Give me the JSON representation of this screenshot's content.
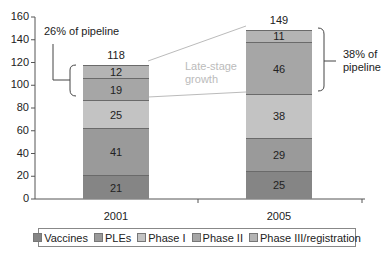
{
  "chart_data": {
    "type": "bar",
    "stacked": true,
    "categories": [
      "2001",
      "2005"
    ],
    "series": [
      {
        "name": "Vaccines",
        "values": [
          21,
          25
        ],
        "color": "#858585"
      },
      {
        "name": "PLEs",
        "values": [
          41,
          29
        ],
        "color": "#9a9a9a"
      },
      {
        "name": "Phase I",
        "values": [
          25,
          38
        ],
        "color": "#c3c3c3"
      },
      {
        "name": "Phase II",
        "values": [
          19,
          46
        ],
        "color": "#a6a6a6"
      },
      {
        "name": "Phase III/registration",
        "values": [
          12,
          11
        ],
        "color": "#b4b4b4"
      }
    ],
    "totals": [
      118,
      149
    ],
    "title": "",
    "xlabel": "",
    "ylabel": "",
    "ylim": [
      0,
      160
    ],
    "yticks": [
      0,
      20,
      40,
      60,
      80,
      100,
      120,
      140,
      160
    ],
    "grid": false,
    "legend_position": "bottom",
    "annotations": [
      {
        "text": "26% of pipeline",
        "target": "2001 Phase II + Phase III/registration"
      },
      {
        "text": "38% of pipeline",
        "target": "2005 Phase II + Phase III/registration"
      },
      {
        "text": "Late-stage growth",
        "target": "between bars"
      }
    ]
  },
  "labels": {
    "ann_2001": "26% of pipeline",
    "ann_2005_line1": "38% of",
    "ann_2005_line2": "pipeline",
    "growth_line1": "Late-stage",
    "growth_line2": "growth"
  }
}
